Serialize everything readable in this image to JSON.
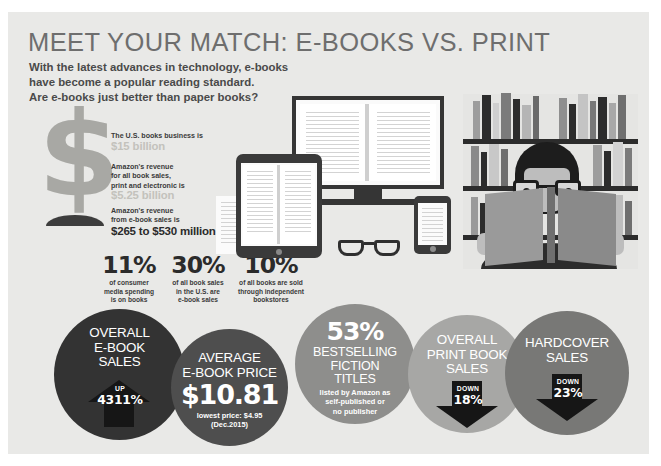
{
  "infographic": {
    "headline": "MEET YOUR MATCH: E-BOOKS VS. PRINT",
    "subhead_line1": "With the latest advances in technology, e-books",
    "subhead_line2": "have become a popular reading standard.",
    "subhead_line3": "Are e-books just better than paper books?",
    "background_color": "#e9e9e7",
    "headline_color": "#6e6e6e",
    "muted_value_color": "#c3c2bc"
  },
  "revenue_stats": [
    {
      "label": "The U.S. books business is",
      "value": "$15 billion",
      "emphasis": "muted"
    },
    {
      "label_line1": "Amazon's revenue",
      "label_line2": "for all book sales,",
      "label_line3": "print and electronic is",
      "value": "$5.25 billion",
      "emphasis": "muted"
    },
    {
      "label_line1": "Amazon's revenue",
      "label_line2": "from e-book sales is",
      "value": "$265 to $530 million",
      "emphasis": "dark"
    }
  ],
  "percent_stats": [
    {
      "number": "11%",
      "desc_line1": "of consumer",
      "desc_line2": "media spending",
      "desc_line3": "is on books"
    },
    {
      "number": "30%",
      "desc_line1": "of all book sales",
      "desc_line2": "in the U.S. are",
      "desc_line3": "e-book sales"
    },
    {
      "number": "10%",
      "desc_line1": "of all books are sold",
      "desc_line2": "through independent",
      "desc_line3": "bookstores"
    }
  ],
  "circles": [
    {
      "title_line1": "OVERALL",
      "title_line2": "E-BOOK",
      "title_line3": "SALES",
      "arrow_direction": "up",
      "arrow_word": "UP",
      "arrow_value": "4311%",
      "fill_color": "#333333"
    },
    {
      "title_line1": "AVERAGE",
      "title_line2": "E-BOOK PRICE",
      "big_value": "$10.81",
      "sub_line1": "lowest price: $4.95",
      "sub_line2": "(Dec.2015)",
      "fill_color": "#4e4e4e"
    },
    {
      "big_value": "53%",
      "title_line1": "BESTSELLING",
      "title_line2": "FICTION",
      "title_line3": "TITLES",
      "sub_line1": "listed by Amazon as",
      "sub_line2": "self-published or",
      "sub_line3": "no publisher",
      "fill_color": "#8e8e8c"
    },
    {
      "title_line1": "OVERALL",
      "title_line2": "PRINT BOOK",
      "title_line3": "SALES",
      "arrow_direction": "down",
      "arrow_word": "DOWN",
      "arrow_value": "18%",
      "fill_color": "#a7a7a5"
    },
    {
      "title_line1": "HARDCOVER",
      "title_line2": "SALES",
      "arrow_direction": "down",
      "arrow_word": "DOWN",
      "arrow_value": "23%",
      "fill_color": "#787876"
    }
  ],
  "illustration": {
    "dollar_symbol": "$",
    "devices": [
      "desktop-monitor",
      "tablet",
      "smartphone",
      "paper-sheet"
    ],
    "accessories": [
      "eyeglasses"
    ],
    "reader_scene": [
      "bookshelf",
      "person-reading-book",
      "eyeglasses"
    ]
  }
}
